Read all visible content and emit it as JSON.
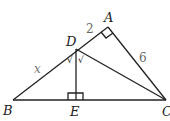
{
  "diagram": {
    "points": {
      "A": {
        "label": "A",
        "x": 108,
        "y": 27
      },
      "B": {
        "label": "B",
        "x": 13,
        "y": 100
      },
      "C": {
        "label": "C",
        "x": 166,
        "y": 100
      },
      "D": {
        "label": "D",
        "x": 76,
        "y": 49
      },
      "E": {
        "label": "E",
        "x": 76,
        "y": 100
      }
    },
    "segments": [
      "AB",
      "AC",
      "BC",
      "DC",
      "DE"
    ],
    "lengths": {
      "AD": "2",
      "AC": "6",
      "BD": "x"
    },
    "right_angles": [
      "A",
      "E"
    ],
    "equal_angle_marks": [
      "∠BDE",
      "∠EDC"
    ],
    "tick_glyph": "√"
  }
}
